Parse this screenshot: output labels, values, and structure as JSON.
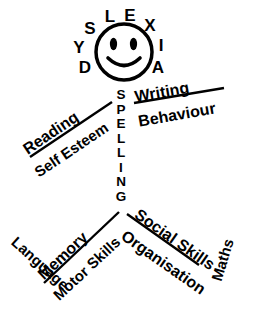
{
  "figure": {
    "ink_color": "#000000",
    "background_color": "#ffffff"
  },
  "head": {
    "name": "smiley-face",
    "ring_word": "DYSLEXIA",
    "letters": [
      {
        "char": "D",
        "x": 85,
        "y": 68
      },
      {
        "char": "Y",
        "x": 79,
        "y": 48
      },
      {
        "char": "S",
        "x": 90,
        "y": 29
      },
      {
        "char": "L",
        "x": 110,
        "y": 17
      },
      {
        "char": "E",
        "x": 130,
        "y": 16
      },
      {
        "char": "X",
        "x": 150,
        "y": 26
      },
      {
        "char": "I",
        "x": 161,
        "y": 46
      },
      {
        "char": "A",
        "x": 158,
        "y": 68
      }
    ]
  },
  "labels": {
    "left_arm": {
      "above": "Reading",
      "below": "Self Esteem"
    },
    "right_arm": {
      "above": "Writing",
      "below": "Behaviour"
    },
    "body": {
      "text": "SPELLING",
      "letters": [
        "S",
        "P",
        "E",
        "L",
        "L",
        "I",
        "N",
        "G"
      ]
    },
    "left_leg": {
      "outer": "Language",
      "above": "Memory",
      "below": "Motor Skills"
    },
    "right_leg": {
      "above": "Social Skills",
      "below": "Organisation",
      "outer": "Maths"
    }
  }
}
